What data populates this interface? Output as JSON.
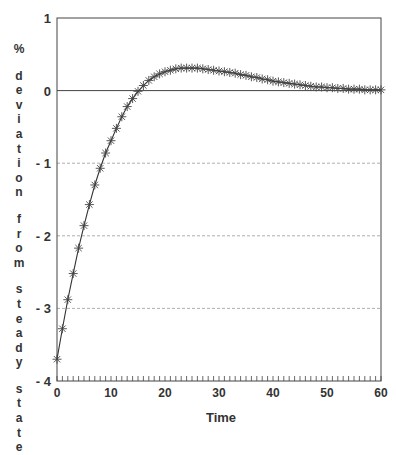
{
  "chart_data": {
    "type": "line",
    "title": "",
    "xlabel": "Time",
    "ylabel": "% deviation from steady state",
    "xlim": [
      0,
      60
    ],
    "ylim": [
      -4,
      1
    ],
    "xticks": [
      0,
      10,
      20,
      30,
      40,
      50,
      60
    ],
    "yticks": [
      1,
      0,
      -1,
      -2,
      -3,
      -4
    ],
    "x_minor_tick_step": 1,
    "grid": "dotted horizontal lines at y = -1, -2, -3; solid reference line at y = 0",
    "legend": "none",
    "marker": "asterisk",
    "series": [
      {
        "name": "% deviation",
        "x": [
          0,
          1,
          2,
          3,
          4,
          5,
          6,
          7,
          8,
          9,
          10,
          11,
          12,
          13,
          14,
          15,
          16,
          17,
          18,
          19,
          20,
          21,
          22,
          23,
          24,
          25,
          26,
          27,
          28,
          29,
          30,
          31,
          32,
          33,
          34,
          35,
          36,
          37,
          38,
          39,
          40,
          41,
          42,
          43,
          44,
          45,
          46,
          47,
          48,
          49,
          50,
          51,
          52,
          53,
          54,
          55,
          56,
          57,
          58,
          59,
          60
        ],
        "values": [
          -3.7,
          -3.28,
          -2.88,
          -2.52,
          -2.17,
          -1.86,
          -1.57,
          -1.3,
          -1.07,
          -0.86,
          -0.69,
          -0.52,
          -0.36,
          -0.22,
          -0.11,
          -0.01,
          0.07,
          0.14,
          0.19,
          0.23,
          0.26,
          0.28,
          0.3,
          0.31,
          0.31,
          0.31,
          0.31,
          0.3,
          0.29,
          0.28,
          0.27,
          0.26,
          0.25,
          0.24,
          0.22,
          0.21,
          0.19,
          0.18,
          0.16,
          0.15,
          0.13,
          0.12,
          0.11,
          0.1,
          0.09,
          0.08,
          0.07,
          0.06,
          0.05,
          0.05,
          0.04,
          0.04,
          0.03,
          0.03,
          0.02,
          0.02,
          0.02,
          0.01,
          0.01,
          0.01,
          0.01
        ]
      }
    ]
  },
  "ylabel_words": [
    "%",
    "deviation",
    "from",
    "steady",
    "state"
  ],
  "colors": {
    "line": "#333333",
    "marker": "#444444",
    "axis": "#444444",
    "grid": "#999999"
  }
}
